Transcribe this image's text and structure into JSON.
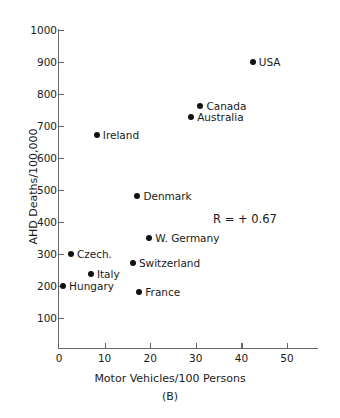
{
  "chart_data": {
    "type": "scatter",
    "title": "",
    "panel_label": "(B)",
    "xlabel": "Motor Vehicles/100 Persons",
    "ylabel": "AHD Deaths/100,000",
    "xlim": [
      0,
      57
    ],
    "ylim": [
      0,
      1000
    ],
    "xticks": [
      0,
      10,
      20,
      30,
      40,
      50
    ],
    "yticks": [
      100,
      200,
      300,
      400,
      500,
      600,
      700,
      800,
      900,
      1000
    ],
    "grid": false,
    "legend": null,
    "annotations": [
      {
        "text": "R = + 0.67",
        "x": 34,
        "y": 410
      }
    ],
    "points": [
      {
        "label": "USA",
        "x": 42.5,
        "y": 900
      },
      {
        "label": "Canada",
        "x": 31.0,
        "y": 762
      },
      {
        "label": "Australia",
        "x": 29.0,
        "y": 727
      },
      {
        "label": "Ireland",
        "x": 8.3,
        "y": 672
      },
      {
        "label": "Denmark",
        "x": 17.2,
        "y": 480
      },
      {
        "label": "W. Germany",
        "x": 19.8,
        "y": 350
      },
      {
        "label": "Czech.",
        "x": 2.6,
        "y": 300
      },
      {
        "label": "Switzerland",
        "x": 16.2,
        "y": 271
      },
      {
        "label": "Italy",
        "x": 7.0,
        "y": 239
      },
      {
        "label": "Hungary",
        "x": 0.9,
        "y": 200
      },
      {
        "label": "France",
        "x": 17.6,
        "y": 180
      }
    ]
  }
}
